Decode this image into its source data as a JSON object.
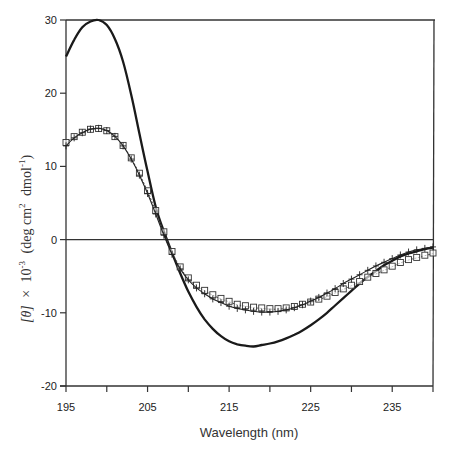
{
  "chart_data": {
    "type": "line",
    "title": "",
    "xlabel": "Wavelength (nm)",
    "ylabel": "[θ] × 10⁻³ (deg cm² dmol⁻¹)",
    "ylabel_parts": {
      "theta": "[θ]",
      "times": "×",
      "ten": "10",
      "exp": "-3",
      "unit_open": "(deg cm",
      "cm_exp": "2",
      "dmol": "dmol",
      "dmol_exp": "-1",
      "close": ")"
    },
    "xlim": [
      195,
      240
    ],
    "ylim": [
      -20,
      30
    ],
    "x_ticks": [
      195,
      200,
      205,
      210,
      215,
      220,
      225,
      230,
      235,
      240
    ],
    "x_tick_labels": [
      "195",
      "205",
      "215",
      "225",
      "235"
    ],
    "y_ticks": [
      30,
      20,
      10,
      0,
      -10,
      -20
    ],
    "y_tick_labels": [
      "30",
      "20",
      "10",
      "0",
      "-10",
      "-20"
    ],
    "grid": false,
    "zero_line": true,
    "legend": null,
    "series": [
      {
        "name": "thick solid line",
        "style": "solid-thick",
        "x": [
          195,
          196,
          197,
          198,
          199,
          200,
          201,
          202,
          203,
          204,
          205,
          206,
          207,
          208,
          209,
          210,
          211,
          212,
          213,
          214,
          215,
          216,
          217,
          218,
          219,
          220,
          221,
          222,
          223,
          224,
          225,
          226,
          227,
          228,
          229,
          230,
          231,
          232,
          233,
          234,
          235,
          236,
          237,
          238,
          239,
          240
        ],
        "values": [
          25.0,
          27.3,
          29.0,
          29.8,
          30.0,
          29.3,
          27.4,
          24.3,
          19.8,
          14.5,
          9.3,
          4.5,
          1.1,
          -1.8,
          -4.6,
          -7.1,
          -9.2,
          -10.9,
          -12.2,
          -13.2,
          -13.9,
          -14.3,
          -14.5,
          -14.6,
          -14.4,
          -14.2,
          -13.9,
          -13.5,
          -13.0,
          -12.4,
          -11.7,
          -10.9,
          -10.0,
          -9.0,
          -8.0,
          -7.0,
          -6.0,
          -5.1,
          -4.3,
          -3.5,
          -2.9,
          -2.3,
          -1.9,
          -1.6,
          -1.3,
          -1.1
        ]
      },
      {
        "name": "open squares",
        "style": "squares-thin-line",
        "x": [
          195,
          196,
          197,
          198,
          199,
          200,
          201,
          202,
          203,
          204,
          205,
          206,
          207,
          208,
          209,
          210,
          211,
          212,
          213,
          214,
          215,
          216,
          217,
          218,
          219,
          220,
          221,
          222,
          223,
          224,
          225,
          226,
          227,
          228,
          229,
          230,
          231,
          232,
          233,
          234,
          235,
          236,
          237,
          238,
          239,
          240
        ],
        "values": [
          13.2,
          14.0,
          14.6,
          15.0,
          15.1,
          14.8,
          14.0,
          12.8,
          11.1,
          9.0,
          6.6,
          3.9,
          1.0,
          -1.7,
          -3.8,
          -5.3,
          -6.3,
          -7.0,
          -7.6,
          -8.1,
          -8.5,
          -8.9,
          -9.1,
          -9.3,
          -9.4,
          -9.5,
          -9.5,
          -9.4,
          -9.2,
          -8.9,
          -8.6,
          -8.2,
          -7.8,
          -7.3,
          -6.8,
          -6.3,
          -5.8,
          -5.2,
          -4.7,
          -4.2,
          -3.7,
          -3.2,
          -2.8,
          -2.5,
          -2.2,
          -1.9
        ]
      },
      {
        "name": "crosses",
        "style": "plus-thin-line",
        "x": [
          195,
          196,
          197,
          198,
          199,
          200,
          201,
          202,
          203,
          204,
          205,
          206,
          207,
          208,
          209,
          210,
          211,
          212,
          213,
          214,
          215,
          216,
          217,
          218,
          219,
          220,
          221,
          222,
          223,
          224,
          225,
          226,
          227,
          228,
          229,
          230,
          231,
          232,
          233,
          234,
          235,
          236,
          237,
          238,
          239,
          240
        ],
        "values": [
          12.8,
          13.9,
          14.6,
          15.1,
          15.2,
          14.9,
          14.1,
          12.8,
          11.0,
          8.8,
          6.3,
          3.5,
          0.6,
          -2.0,
          -4.0,
          -5.5,
          -6.6,
          -7.4,
          -8.1,
          -8.6,
          -9.1,
          -9.4,
          -9.6,
          -9.8,
          -9.9,
          -9.9,
          -9.8,
          -9.6,
          -9.3,
          -8.9,
          -8.4,
          -7.9,
          -7.3,
          -6.7,
          -6.0,
          -5.4,
          -4.8,
          -4.2,
          -3.6,
          -3.1,
          -2.6,
          -2.1,
          -1.7,
          -1.4,
          -1.2,
          -1.0
        ]
      }
    ]
  }
}
